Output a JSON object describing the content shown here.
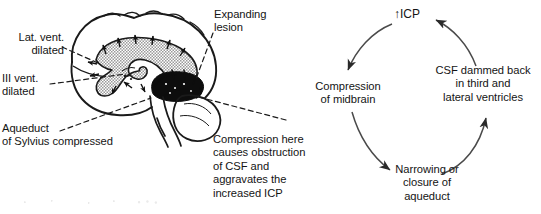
{
  "figure": {
    "illustration": {
      "name": "sagittal-brain-with-expanding-lesion",
      "labels": {
        "lateral_ventricle": "Lat. vent.\ndilated",
        "third_ventricle": "III vent.\ndilated",
        "aqueduct": "Aqueduct\nof Sylvius compressed",
        "expanding_lesion": "Expanding\nlesion",
        "compression_note": "Compression here\ncauses obstruction\nof CSF and\naggravates the\nincreased ICP"
      },
      "parts": {
        "skull_outline": "brain-outline",
        "lateral_ventricle_region": "stippled-dilated-ventricle",
        "lesion_mass": "dark-scribbled-tumour-mass",
        "brainstem": "brainstem",
        "cerebellum": "cerebellum",
        "pressure_arrows": "outward-pressure-arrowheads"
      }
    },
    "cycle": {
      "name": "vicious-cycle-raised-icp",
      "nodes": [
        {
          "id": "icp",
          "label": "↑ICP"
        },
        {
          "id": "midbrain",
          "label": "Compression\nof midbrain"
        },
        {
          "id": "aqueduct",
          "label": "Narrowing or\nclosure of\naqueduct"
        },
        {
          "id": "csf",
          "label": "CSF dammed back\nin third and\nlateral ventricles"
        }
      ],
      "arrows": [
        {
          "from": "icp",
          "to": "midbrain"
        },
        {
          "from": "midbrain",
          "to": "aqueduct"
        },
        {
          "from": "aqueduct",
          "to": "csf"
        },
        {
          "from": "csf",
          "to": "icp"
        }
      ]
    }
  },
  "colors": {
    "ink": "#141414",
    "line": "#1a1a1a",
    "arrow": "#3c3c3c",
    "ventricle_fill": "#b8b8b8",
    "lesion": "#0d0d0d",
    "background": "#ffffff"
  }
}
